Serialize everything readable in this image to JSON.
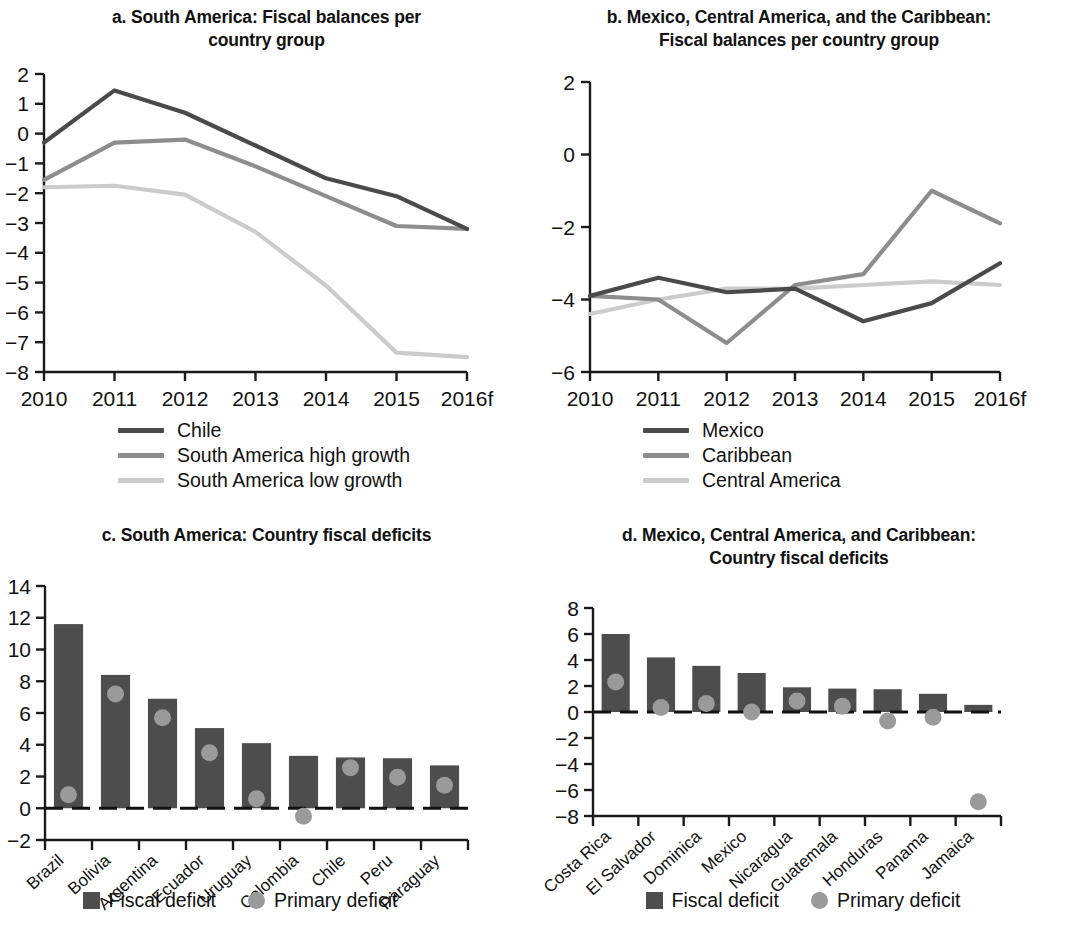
{
  "colors": {
    "dark": "#4a4a4a",
    "mid": "#8d8d8d",
    "light": "#cbcbcb",
    "bar": "#4d4d4d",
    "dot": "#9a9a9a",
    "axis": "#1a1a1a"
  },
  "panels": {
    "a": {
      "title_line1": "a. South America: Fiscal balances per",
      "title_line2": "country group",
      "legend": [
        {
          "label": "Chile",
          "color": "#4a4a4a"
        },
        {
          "label": "South America high growth",
          "color": "#8d8d8d"
        },
        {
          "label": "South America low growth",
          "color": "#cbcbcb"
        }
      ]
    },
    "b": {
      "title_line1": "b. Mexico, Central America, and the Caribbean:",
      "title_line2": "Fiscal balances per country group",
      "legend": [
        {
          "label": "Mexico",
          "color": "#4a4a4a"
        },
        {
          "label": "Caribbean",
          "color": "#8d8d8d"
        },
        {
          "label": "Central America",
          "color": "#cbcbcb"
        }
      ]
    },
    "c": {
      "title_line1": "c. South America: Country fiscal deficits",
      "title_line2": "",
      "legend": [
        {
          "label": "Fiscal deficit",
          "marker": "square",
          "color": "#4d4d4d"
        },
        {
          "label": "Primary deficit",
          "marker": "circle",
          "color": "#9a9a9a"
        }
      ]
    },
    "d": {
      "title_line1": "d. Mexico, Central America, and Caribbean:",
      "title_line2": "Country fiscal deficits",
      "legend": [
        {
          "label": "Fiscal deficit",
          "marker": "square",
          "color": "#4d4d4d"
        },
        {
          "label": "Primary deficit",
          "marker": "circle",
          "color": "#9a9a9a"
        }
      ]
    }
  },
  "chart_data": [
    {
      "id": "a",
      "type": "line",
      "title": "a. South America: Fiscal balances per country group",
      "xlabel": "",
      "ylabel": "",
      "x": [
        "2010",
        "2011",
        "2012",
        "2013",
        "2014",
        "2015",
        "2016f"
      ],
      "xticklabels": [
        "2010",
        "2011",
        "2012",
        "2013",
        "2014",
        "2015",
        "2016f"
      ],
      "yticklabels": [
        "2",
        "1",
        "0",
        "-1",
        "-2",
        "-3",
        "-4",
        "-5",
        "-6",
        "-7",
        "-8"
      ],
      "ylim": [
        -8,
        2
      ],
      "ytick_step": 1,
      "grid": false,
      "legend_position": "below",
      "series": [
        {
          "name": "Chile",
          "color": "#4a4a4a",
          "values": [
            -0.3,
            1.45,
            0.7,
            -0.4,
            -1.5,
            -2.1,
            -3.2
          ]
        },
        {
          "name": "South America high growth",
          "color": "#8d8d8d",
          "values": [
            -1.55,
            -0.3,
            -0.2,
            -1.1,
            -2.1,
            -3.1,
            -3.2
          ]
        },
        {
          "name": "South America low growth",
          "color": "#cbcbcb",
          "values": [
            -1.8,
            -1.75,
            -2.05,
            -3.3,
            -5.1,
            -7.35,
            -7.5
          ]
        }
      ]
    },
    {
      "id": "b",
      "type": "line",
      "title": "b. Mexico, Central America, and the Caribbean: Fiscal balances per country group",
      "xlabel": "",
      "ylabel": "",
      "x": [
        "2010",
        "2011",
        "2012",
        "2013",
        "2014",
        "2015",
        "2016f"
      ],
      "xticklabels": [
        "2010",
        "2011",
        "2012",
        "2013",
        "2014",
        "2015",
        "2016f"
      ],
      "yticklabels": [
        "2",
        "0",
        "-2",
        "-4",
        "-6"
      ],
      "ylim": [
        -6,
        2
      ],
      "ytick_step": 2,
      "grid": false,
      "legend_position": "below",
      "series": [
        {
          "name": "Mexico",
          "color": "#4a4a4a",
          "values": [
            -3.9,
            -3.4,
            -3.8,
            -3.7,
            -4.6,
            -4.1,
            -3.0
          ]
        },
        {
          "name": "Caribbean",
          "color": "#8d8d8d",
          "values": [
            -3.9,
            -4.0,
            -5.2,
            -3.6,
            -3.3,
            -1.0,
            -1.9
          ]
        },
        {
          "name": "Central America",
          "color": "#cbcbcb",
          "values": [
            -4.4,
            -4.0,
            -3.7,
            -3.7,
            -3.6,
            -3.5,
            -3.6
          ]
        }
      ]
    },
    {
      "id": "c",
      "type": "bar",
      "title": "c. South America: Country fiscal deficits",
      "xlabel": "",
      "ylabel": "",
      "categories": [
        "Brazil",
        "Bolivia",
        "Argentina",
        "Ecuador",
        "Uruguay",
        "Colombia",
        "Chile",
        "Peru",
        "Paraguay"
      ],
      "yticklabels": [
        "14",
        "12",
        "10",
        "8",
        "6",
        "4",
        "2",
        "0",
        "-2"
      ],
      "ylim": [
        -2,
        14
      ],
      "ytick_step": 2,
      "grid": false,
      "legend_position": "below",
      "series": [
        {
          "name": "Fiscal deficit",
          "type": "bar",
          "color": "#4d4d4d",
          "values": [
            11.6,
            8.4,
            6.9,
            5.05,
            4.1,
            3.3,
            3.2,
            3.15,
            2.7
          ]
        },
        {
          "name": "Primary deficit",
          "type": "scatter",
          "color": "#9a9a9a",
          "values": [
            0.85,
            7.2,
            5.7,
            3.5,
            0.6,
            -0.5,
            2.55,
            1.95,
            1.45
          ]
        }
      ]
    },
    {
      "id": "d",
      "type": "bar",
      "title": "d. Mexico, Central America, and Caribbean: Country fiscal deficits",
      "xlabel": "",
      "ylabel": "",
      "categories": [
        "Costa Rica",
        "El Salvador",
        "Dominica",
        "Mexico",
        "Nicaragua",
        "Guatemala",
        "Honduras",
        "Panama",
        "Jamaica"
      ],
      "yticklabels": [
        "8",
        "6",
        "4",
        "2",
        "0",
        "-2",
        "-4",
        "-6",
        "-8"
      ],
      "ylim": [
        -8,
        8
      ],
      "ytick_step": 2,
      "grid": false,
      "legend_position": "below",
      "series": [
        {
          "name": "Fiscal deficit",
          "type": "bar",
          "color": "#4d4d4d",
          "values": [
            6.0,
            4.2,
            3.55,
            3.0,
            1.9,
            1.8,
            1.75,
            1.4,
            0.55
          ]
        },
        {
          "name": "Primary deficit",
          "type": "scatter",
          "color": "#9a9a9a",
          "values": [
            2.3,
            0.35,
            0.65,
            0.0,
            0.85,
            0.45,
            -0.7,
            -0.4,
            -6.9
          ]
        }
      ]
    }
  ]
}
